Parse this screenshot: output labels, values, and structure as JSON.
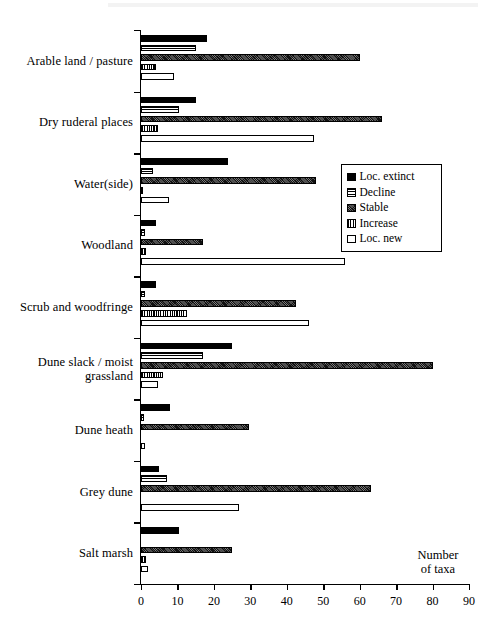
{
  "chart_data": {
    "type": "bar",
    "orientation": "horizontal",
    "title": "",
    "xlabel": "Number of taxa",
    "ylabel": "",
    "xlim": [
      0,
      90
    ],
    "xticks": [
      0,
      10,
      20,
      30,
      40,
      50,
      60,
      70,
      80,
      90
    ],
    "grid": false,
    "legend_position": "center-right",
    "categories": [
      "Arable land / pasture",
      "Dry ruderal places",
      "Water(side)",
      "Woodland",
      "Scrub and woodfringe",
      "Dune slack / moist grassland",
      "Dune heath",
      "Grey dune",
      "Salt marsh"
    ],
    "series": [
      {
        "name": "Loc. extinct",
        "values": [
          18,
          15,
          24,
          4,
          4,
          25,
          8,
          5,
          10.5
        ]
      },
      {
        "name": "Decline",
        "values": [
          15,
          10.5,
          3.3,
          1.1,
          1,
          17,
          0.8,
          7,
          0
        ]
      },
      {
        "name": "Stable",
        "values": [
          60,
          66,
          48,
          17,
          42.5,
          80,
          29.5,
          63,
          25
        ]
      },
      {
        "name": "Increase",
        "values": [
          4,
          4.7,
          0.5,
          1.5,
          12.7,
          6,
          0,
          0,
          1.5
        ]
      },
      {
        "name": "Loc. new",
        "values": [
          9,
          47.5,
          7.8,
          56,
          46,
          4.7,
          1,
          27,
          2
        ]
      }
    ]
  },
  "legend": {
    "items": [
      {
        "label": "Loc. extinct",
        "swatch": "solid-black"
      },
      {
        "label": "Decline",
        "swatch": "horizontal-lines"
      },
      {
        "label": "Stable",
        "swatch": "dense-crosshatch"
      },
      {
        "label": "Increase",
        "swatch": "vertical-lines"
      },
      {
        "label": "Loc. new",
        "swatch": "white"
      }
    ]
  },
  "axis": {
    "x_title_line1": "Number",
    "x_title_line2": "of taxa",
    "tick_labels": [
      "0",
      "10",
      "20",
      "30",
      "40",
      "50",
      "60",
      "70",
      "80",
      "90"
    ]
  }
}
